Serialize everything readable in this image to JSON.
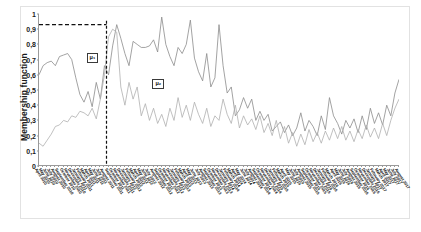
{
  "chart_data": {
    "type": "line",
    "title": "",
    "xlabel": "",
    "ylabel": "Membership function",
    "ylim": [
      0,
      1
    ],
    "yticks": [
      0,
      0.1,
      0.2,
      0.3,
      0.4,
      0.5,
      0.6,
      0.7,
      0.8,
      0.9,
      1
    ],
    "ytick_labels": [
      "0",
      "0,1",
      "0,2",
      "0,3",
      "0,4",
      "0,5",
      "0,6",
      "0,7",
      "0,8",
      "0,9",
      "1"
    ],
    "grid": false,
    "legend": "none",
    "x": [
      "April 2010",
      "May 2010",
      "June 2010",
      "July 2010",
      "August 2010",
      "September 2010",
      "October 2010",
      "November 2010",
      "December 2010",
      "January 2011",
      "February 2011",
      "March 2011",
      "April 2011",
      "May 2011",
      "June 2011",
      "July 2011",
      "August 2011",
      "September 2011",
      "October 2011",
      "November 2011",
      "December 2011",
      "January 2012",
      "February 2012",
      "March 2012",
      "April 2012",
      "May 2012",
      "June 2012",
      "July 2012",
      "August 2012",
      "September 2012",
      "October 2012",
      "November 2012",
      "December 2012",
      "January 2013",
      "February 2013",
      "March 2013",
      "April 2013",
      "May 2013",
      "June 2013",
      "July 2013",
      "August 2013",
      "September 2013",
      "October 2013",
      "November 2013",
      "December 2013",
      "January 2014",
      "February 2014",
      "March 2014",
      "April 2014",
      "May 2014",
      "June 2014",
      "July 2014",
      "August 2014",
      "September 2014",
      "October 2014",
      "November 2014",
      "December 2014",
      "January 2015",
      "February 2015",
      "March 2015",
      "April 2015",
      "May 2015",
      "June 2015",
      "July 2015",
      "August 2015",
      "September 2015",
      "October 2015",
      "November 2015",
      "December 2015",
      "January 2016",
      "February 2016",
      "March 2016",
      "April 2016",
      "May 2016",
      "June 2016",
      "July 2016",
      "August 2016",
      "September 2016",
      "October 2016",
      "November 2016",
      "December 2016",
      "January 2017",
      "February 2017",
      "March 2017",
      "April 2017",
      "May 2017",
      "June 2017",
      "July 2017",
      "August 2017"
    ],
    "series": [
      {
        "name": "series-1",
        "color": "#8c8c8c",
        "values": [
          0.6,
          0.66,
          0.68,
          0.69,
          0.66,
          0.72,
          0.73,
          0.74,
          0.7,
          0.58,
          0.47,
          0.42,
          0.49,
          0.39,
          0.55,
          0.44,
          0.66,
          0.6,
          0.79,
          0.93,
          0.84,
          0.74,
          0.66,
          0.82,
          0.8,
          0.78,
          0.78,
          0.79,
          0.83,
          0.75,
          0.98,
          0.8,
          0.72,
          0.66,
          0.78,
          0.74,
          0.8,
          0.96,
          0.71,
          0.62,
          0.56,
          0.74,
          0.52,
          0.58,
          0.93,
          0.66,
          0.48,
          0.52,
          0.33,
          0.37,
          0.45,
          0.38,
          0.44,
          0.3,
          0.36,
          0.3,
          0.34,
          0.23,
          0.26,
          0.29,
          0.22,
          0.27,
          0.2,
          0.25,
          0.35,
          0.23,
          0.3,
          0.26,
          0.2,
          0.33,
          0.24,
          0.45,
          0.33,
          0.28,
          0.21,
          0.3,
          0.25,
          0.31,
          0.22,
          0.33,
          0.24,
          0.38,
          0.28,
          0.35,
          0.27,
          0.4,
          0.33,
          0.48,
          0.57
        ]
      },
      {
        "name": "series-2",
        "color": "#b0b0b0",
        "values": [
          0.15,
          0.13,
          0.17,
          0.21,
          0.26,
          0.27,
          0.3,
          0.29,
          0.33,
          0.32,
          0.36,
          0.35,
          0.33,
          0.38,
          0.31,
          0.44,
          0.6,
          0.85,
          0.9,
          0.88,
          0.52,
          0.4,
          0.55,
          0.44,
          0.52,
          0.33,
          0.41,
          0.3,
          0.38,
          0.28,
          0.34,
          0.26,
          0.38,
          0.3,
          0.45,
          0.32,
          0.4,
          0.3,
          0.42,
          0.34,
          0.28,
          0.38,
          0.26,
          0.33,
          0.3,
          0.44,
          0.34,
          0.28,
          0.4,
          0.25,
          0.33,
          0.27,
          0.31,
          0.24,
          0.33,
          0.22,
          0.28,
          0.2,
          0.3,
          0.18,
          0.26,
          0.15,
          0.22,
          0.13,
          0.21,
          0.14,
          0.24,
          0.16,
          0.22,
          0.15,
          0.23,
          0.17,
          0.25,
          0.18,
          0.26,
          0.17,
          0.23,
          0.16,
          0.24,
          0.18,
          0.27,
          0.19,
          0.25,
          0.18,
          0.28,
          0.2,
          0.3,
          0.38,
          0.44
        ]
      }
    ],
    "annotations": [
      {
        "name": "mu-1",
        "label": "μ₁",
        "x_frac": 0.132,
        "y_value": 0.715
      },
      {
        "name": "mu-2",
        "label": "μ₂",
        "x_frac": 0.315,
        "y_value": 0.545
      },
      {
        "name": "threshold-line",
        "type": "horizontal-dashed",
        "y_value": 0.93
      },
      {
        "name": "peak-line",
        "type": "vertical-dashed",
        "x_frac": 0.1875
      }
    ]
  }
}
